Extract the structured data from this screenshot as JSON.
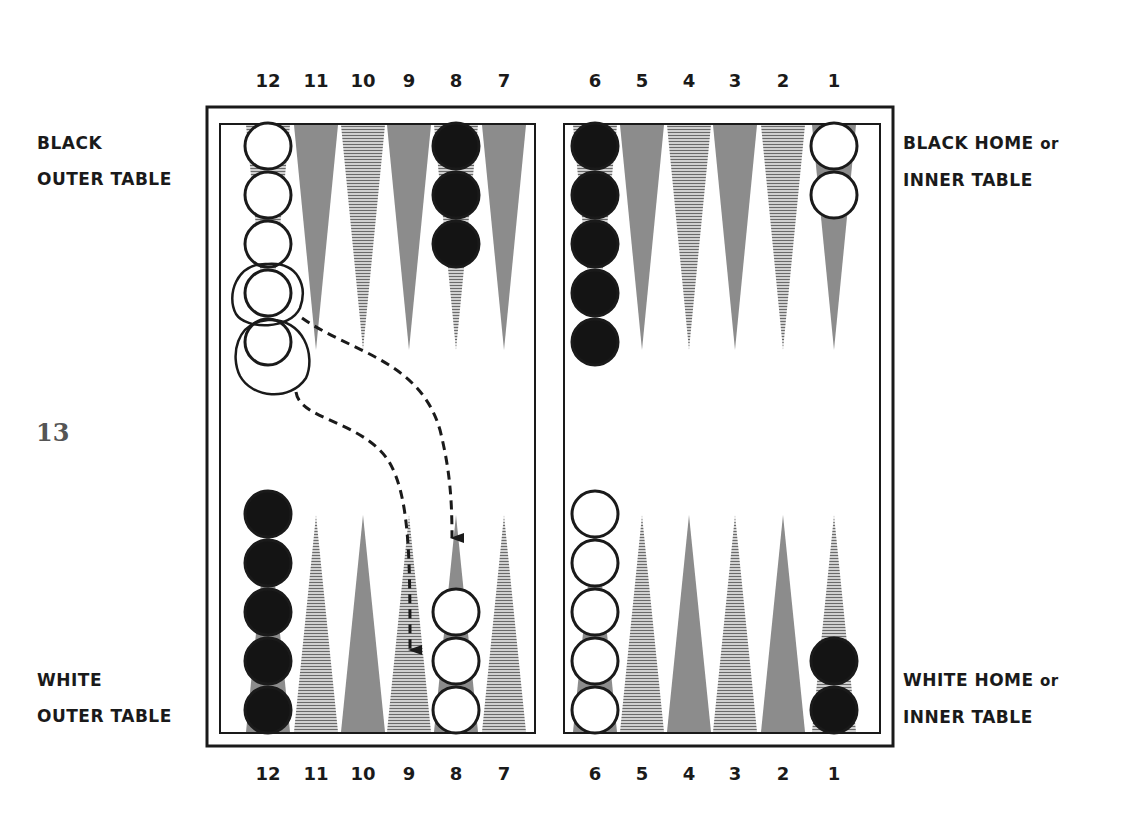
{
  "page_number": "13",
  "labels": {
    "black_outer": [
      "BLACK",
      "OUTER TABLE"
    ],
    "black_home": [
      "BLACK HOME",
      "or",
      "INNER TABLE"
    ],
    "white_outer": [
      "WHITE",
      "OUTER TABLE"
    ],
    "white_home": [
      "WHITE HOME",
      "or",
      "INNER TABLE"
    ]
  },
  "point_numbers_top": [
    "12",
    "11",
    "10",
    "9",
    "8",
    "7",
    "6",
    "5",
    "4",
    "3",
    "2",
    "1"
  ],
  "point_numbers_bottom": [
    "12",
    "11",
    "10",
    "9",
    "8",
    "7",
    "6",
    "5",
    "4",
    "3",
    "2",
    "1"
  ],
  "point_x": [
    268,
    316,
    363,
    409,
    456,
    504,
    595,
    642,
    689,
    735,
    783,
    834
  ],
  "colors": {
    "frame": "#1a1a1a",
    "point_solid": "#8c8c8c",
    "point_hatched": "#9a9a9a",
    "black_checker": "#141414",
    "white_checker": "#ffffff",
    "background": "#ffffff"
  },
  "checkers": {
    "top": [
      {
        "point": "12",
        "color": "white",
        "count": 5
      },
      {
        "point": "8",
        "color": "black",
        "count": 3
      },
      {
        "point": "6",
        "color": "black",
        "count": 5
      },
      {
        "point": "1",
        "color": "white",
        "count": 2
      }
    ],
    "bottom": [
      {
        "point": "12",
        "color": "black",
        "count": 5
      },
      {
        "point": "8",
        "color": "white",
        "count": 3
      },
      {
        "point": "6",
        "color": "white",
        "count": 5
      },
      {
        "point": "1",
        "color": "black",
        "count": 2
      }
    ]
  },
  "moves": [
    {
      "from": "white point 12 (top)",
      "to": "point 8 (bottom)",
      "style": "dashed-arrow"
    },
    {
      "from": "white point 12 (top)",
      "to": "point 9 (bottom)",
      "style": "dashed-arrow"
    }
  ]
}
